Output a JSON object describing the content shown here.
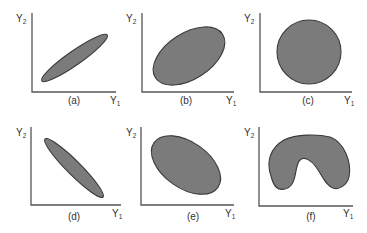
{
  "figure": {
    "colors": {
      "fill": "#7b7b7b",
      "stroke": "#3a3a3a",
      "axis": "#555555",
      "text": "#333333"
    },
    "axis_labels": {
      "y": "Y",
      "y_sub": "2",
      "x": "Y",
      "x_sub": "1"
    },
    "panels": [
      {
        "id": "a",
        "caption": "(a)",
        "shape": "narrow ellipse, positive slope"
      },
      {
        "id": "b",
        "caption": "(b)",
        "shape": "wide ellipse, positive slope"
      },
      {
        "id": "c",
        "caption": "(c)",
        "shape": "circle"
      },
      {
        "id": "d",
        "caption": "(d)",
        "shape": "narrow ellipse, negative slope"
      },
      {
        "id": "e",
        "caption": "(e)",
        "shape": "wide ellipse, negative slope"
      },
      {
        "id": "f",
        "caption": "(f)",
        "shape": "horseshoe / non-linear"
      }
    ]
  }
}
